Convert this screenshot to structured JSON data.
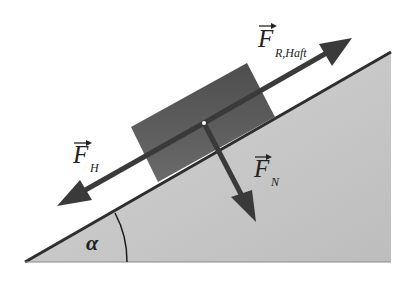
{
  "diagram": {
    "colors": {
      "background": "#ffffff",
      "incline_fill": "#c8c8c8",
      "incline_edge": "#2e2e2e",
      "block_fill": "#5a5a5a",
      "arrow": "#3a3a3a",
      "text": "#222222"
    },
    "labels": {
      "friction_force_main": "F",
      "friction_force_sub": "R,Haft",
      "downhill_force_main": "F",
      "downhill_force_sub": "H",
      "normal_force_main": "F",
      "normal_force_sub": "N",
      "angle": "α"
    }
  }
}
